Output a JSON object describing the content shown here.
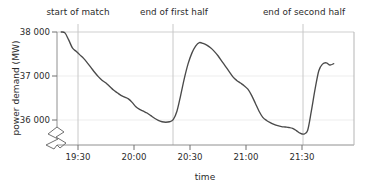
{
  "chart_data": {
    "type": "line",
    "title": "",
    "xlabel": "time",
    "ylabel": "power demand (MW)",
    "ylim": [
      35550,
      38000
    ],
    "xlim": [
      "19:20",
      "21:48"
    ],
    "grid": true,
    "legend": "none",
    "y_axis_broken": true,
    "y_ticks": [
      36000,
      37000,
      38000
    ],
    "y_tick_labels": [
      "36 000",
      "37 000",
      "38 000"
    ],
    "x_ticks": [
      "19:30",
      "20:00",
      "20:30",
      "21:00",
      "21:30"
    ],
    "x_tick_labels": [
      "19:30",
      "20:00",
      "20:30",
      "21:00",
      "21:30"
    ],
    "annotations": [
      {
        "label": "start of match",
        "x": "19:30"
      },
      {
        "label": "end of first half",
        "x": "20:21"
      },
      {
        "label": "end of second half",
        "x": "21:30"
      }
    ],
    "series": [
      {
        "name": "power demand",
        "color": "#4a4a4a",
        "x": [
          "19:21",
          "19:23",
          "19:25",
          "19:27",
          "19:29",
          "19:31",
          "19:33",
          "19:35",
          "19:37",
          "19:39",
          "19:41",
          "19:43",
          "19:45",
          "19:47",
          "19:49",
          "19:51",
          "19:53",
          "19:55",
          "19:57",
          "19:59",
          "20:01",
          "20:03",
          "20:05",
          "20:07",
          "20:09",
          "20:11",
          "20:13",
          "20:15",
          "20:17",
          "20:19",
          "20:21",
          "20:23",
          "20:25",
          "20:27",
          "20:29",
          "20:31",
          "20:33",
          "20:35",
          "20:37",
          "20:39",
          "20:41",
          "20:43",
          "20:45",
          "20:47",
          "20:49",
          "20:51",
          "20:53",
          "20:55",
          "20:57",
          "20:59",
          "21:01",
          "21:03",
          "21:05",
          "21:07",
          "21:09",
          "21:11",
          "21:13",
          "21:15",
          "21:17",
          "21:19",
          "21:21",
          "21:23",
          "21:25",
          "21:27",
          "21:29",
          "21:31",
          "21:33",
          "21:35",
          "21:37",
          "21:39",
          "21:41",
          "21:43",
          "21:45",
          "21:47"
        ],
        "y": [
          38000,
          37980,
          37820,
          37640,
          37560,
          37480,
          37400,
          37300,
          37190,
          37080,
          36980,
          36900,
          36840,
          36760,
          36680,
          36620,
          36560,
          36520,
          36480,
          36400,
          36300,
          36240,
          36200,
          36160,
          36100,
          36040,
          35990,
          35960,
          35950,
          35960,
          36010,
          36200,
          36560,
          36950,
          37280,
          37520,
          37680,
          37760,
          37740,
          37700,
          37640,
          37560,
          37460,
          37340,
          37220,
          37100,
          36980,
          36900,
          36840,
          36780,
          36700,
          36560,
          36380,
          36200,
          36060,
          35990,
          35940,
          35900,
          35870,
          35850,
          35840,
          35830,
          35810,
          35760,
          35700,
          35680,
          35760,
          36200,
          36700,
          37120,
          37270,
          37300,
          37250,
          37280
        ]
      }
    ]
  },
  "axis_break": {
    "name": "y-axis-break-symbol",
    "description": "zigzag break mark on y axis near origin"
  },
  "styling": {
    "line_color": "#4a4a4a",
    "grid_color": "#e6e6e6",
    "axis_color": "#808080",
    "text_color": "#2b2b2b",
    "background": "#ffffff"
  }
}
